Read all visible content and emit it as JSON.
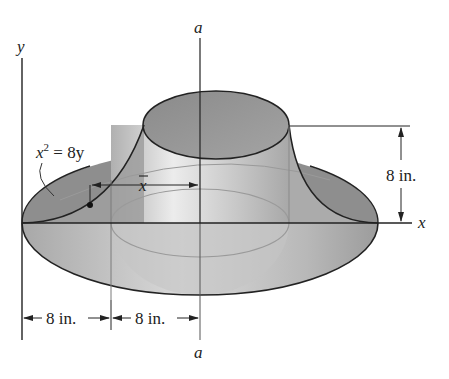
{
  "figure": {
    "axes": {
      "y_label": "y",
      "x_label": "x",
      "axis_a_top_label": "a",
      "axis_a_bottom_label": "a"
    },
    "curve_equation": {
      "lhs_base": "x",
      "lhs_exp": "2",
      "rhs": " = 8y"
    },
    "centroid_distance_label": "x",
    "dimensions": {
      "height": "8 in.",
      "bottom_left": "8 in.",
      "bottom_right": "8 in."
    },
    "colors": {
      "line": "#222222",
      "shade_dark": "#8c8c8c",
      "shade_mid": "#b4b4b4",
      "shade_light": "#e6e6e6",
      "inner_line": "#9a9a9a"
    }
  }
}
